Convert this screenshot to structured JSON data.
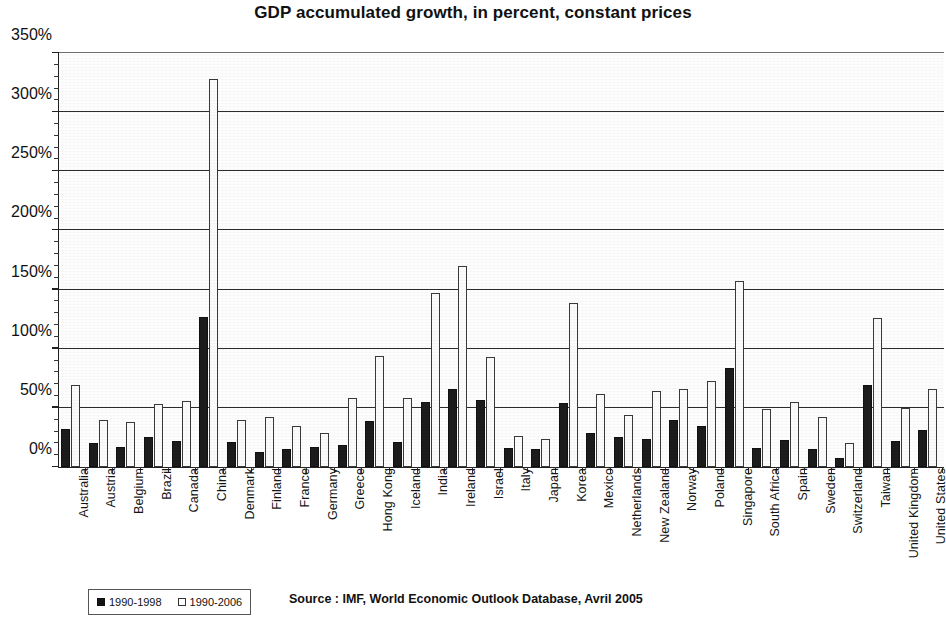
{
  "chart_data": {
    "type": "bar",
    "title": "GDP accumulated growth, in percent, constant prices",
    "xlabel": "",
    "ylabel": "",
    "ylim": [
      0,
      350
    ],
    "ytick_step": 50,
    "ytick_labels": [
      "0%",
      "50%",
      "100%",
      "150%",
      "200%",
      "250%",
      "300%",
      "350%"
    ],
    "grid": true,
    "legend_position": "bottom-left",
    "minor_ticks": true,
    "categories": [
      "Australia",
      "Austria",
      "Belgium",
      "Brazil",
      "Canada",
      "China",
      "Denmark",
      "Finland",
      "France",
      "Germany",
      "Greece",
      "Hong Kong",
      "Iceland",
      "India",
      "Ireland",
      "Israel",
      "Italy",
      "Japan",
      "Korea",
      "Mexico",
      "Netherlands",
      "New Zealand",
      "Norway",
      "Poland",
      "Singapore",
      "South Africa",
      "Spain",
      "Sweden",
      "Switzerland",
      "Taiwan",
      "United Kingdom",
      "United States"
    ],
    "series": [
      {
        "name": "1990-1998",
        "color": "#1c1c1c",
        "values": [
          32,
          20,
          17,
          25,
          22,
          127,
          21,
          13,
          15,
          17,
          19,
          39,
          21,
          55,
          66,
          57,
          16,
          15,
          54,
          29,
          25,
          24,
          40,
          35,
          84,
          16,
          23,
          15,
          8,
          69,
          22,
          31
        ]
      },
      {
        "name": "1990-2006",
        "color": "#fbfbfb",
        "values": [
          69,
          40,
          38,
          53,
          56,
          328,
          40,
          42,
          35,
          29,
          58,
          94,
          58,
          147,
          170,
          93,
          26,
          24,
          139,
          62,
          44,
          64,
          66,
          73,
          157,
          49,
          55,
          42,
          20,
          126,
          50,
          66
        ]
      }
    ]
  },
  "legend": {
    "items": [
      {
        "label": "1990-1998",
        "swatch": "filled-black-square"
      },
      {
        "label": "1990-2006",
        "swatch": "hollow-white-square"
      }
    ]
  },
  "footer": {
    "source": "Source : IMF, World Economic Outlook Database, Avril 2005"
  }
}
